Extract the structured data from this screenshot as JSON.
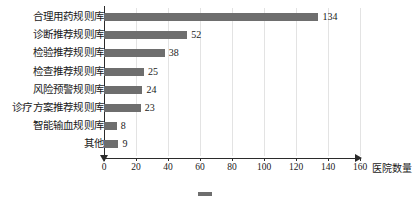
{
  "chart_data": {
    "type": "bar",
    "orientation": "horizontal",
    "title": "",
    "xlabel": "医院数量",
    "ylabel": "",
    "xlim": [
      0,
      160
    ],
    "xticks": [
      0,
      20,
      40,
      60,
      80,
      100,
      120,
      140,
      160
    ],
    "grid": "vertical",
    "legend": "none",
    "bar_color": "#6e6e6e",
    "axis_color": "#2b2b2b",
    "gridline_color": "#e3e3e3",
    "categories": [
      "合理用药规则库",
      "诊断推荐规则库",
      "检验推荐规则库",
      "检查推荐规则库",
      "风险预警规则库",
      "诊疗方案推荐规则库",
      "智能输血规则库",
      "其他"
    ],
    "values": [
      134,
      52,
      38,
      25,
      24,
      23,
      8,
      9
    ],
    "value_labels": [
      "134",
      "52",
      "38",
      "25",
      "24",
      "23",
      "8",
      "9"
    ],
    "tick_labels": [
      "0",
      "20",
      "40",
      "60",
      "80",
      "100",
      "120",
      "140",
      "160"
    ]
  },
  "caption": {
    "text": ""
  }
}
